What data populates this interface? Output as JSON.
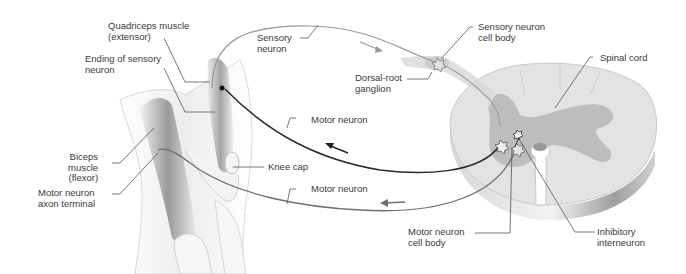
{
  "diagram": {
    "type": "knee-jerk reflex arc",
    "colors": {
      "motor_neuron_dark": "#2a2a2a",
      "motor_neuron_gray": "#6e6e6e",
      "sensory_neuron": "#9a9a9a",
      "white_matter": "#e3e3e3",
      "gray_matter": "#bdbdbd",
      "leader_line": "#555555",
      "label_text": "#3a3a3a"
    },
    "labels": {
      "quadriceps": "Quadriceps muscle\n(extensor)",
      "ending_sensory": "Ending of sensory\nneuron",
      "biceps": "Biceps\nmuscle\n(flexor)",
      "motor_axon_terminal": "Motor neuron\naxon terminal",
      "sensory_neuron": "Sensory\nneuron",
      "dorsal_root": "Dorsal-root\nganglion",
      "sensory_cell_body": "Sensory neuron\ncell body",
      "spinal_cord": "Spinal cord",
      "motor_neuron_upper": "Motor neuron",
      "knee_cap": "Knee cap",
      "motor_neuron_lower": "Motor neuron",
      "motor_cell_body": "Motor neuron\ncell body",
      "inhibitory_interneuron": "Inhibitory\ninterneuron"
    },
    "arrows": [
      {
        "path": "sensory-neuron",
        "direction": "toward spinal cord"
      },
      {
        "path": "motor-neuron-upper",
        "direction": "toward quadriceps"
      },
      {
        "path": "motor-neuron-lower",
        "direction": "toward biceps"
      }
    ]
  }
}
